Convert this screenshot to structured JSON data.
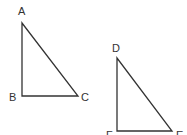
{
  "diagram": {
    "type": "two right triangles",
    "stroke_color": "#333333",
    "triangles": [
      {
        "name": "ABC",
        "vertices": {
          "A": {
            "label": "A",
            "x": 22,
            "y": 23
          },
          "B": {
            "label": "B",
            "x": 22,
            "y": 96
          },
          "C": {
            "label": "C",
            "x": 78,
            "y": 96
          }
        },
        "right_angle_at": "B"
      },
      {
        "name": "DEF",
        "vertices": {
          "D": {
            "label": "D",
            "x": 117,
            "y": 58
          },
          "F": {
            "label": "F",
            "x": 117,
            "y": 131
          },
          "E": {
            "label": "E",
            "x": 172,
            "y": 131
          }
        },
        "right_angle_at": "F"
      }
    ]
  }
}
